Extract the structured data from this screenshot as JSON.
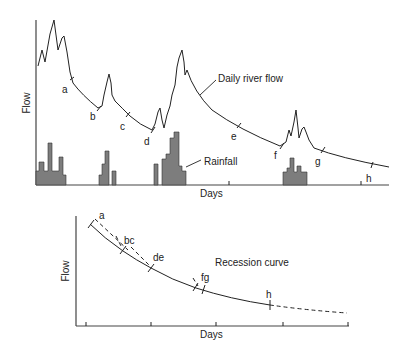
{
  "top_chart": {
    "y_label": "Flow",
    "x_label": "Days",
    "series_label": "Daily river flow",
    "rainfall_label": "Rainfall",
    "points": [
      "a",
      "b",
      "c",
      "d",
      "e",
      "f",
      "g",
      "h"
    ]
  },
  "bottom_chart": {
    "y_label": "Flow",
    "x_label": "Days",
    "curve_label": "Recession curve",
    "points": [
      "a",
      "bc",
      "de",
      "fg",
      "h"
    ]
  },
  "colors": {
    "line": "#222222",
    "rainfall_fill": "#7d7d7d",
    "axis": "#444444"
  }
}
